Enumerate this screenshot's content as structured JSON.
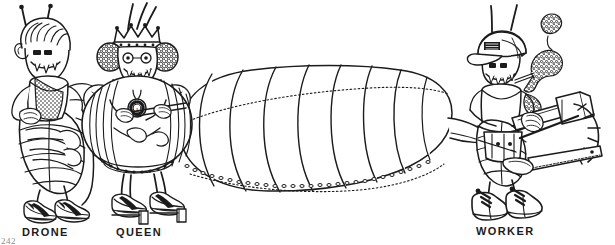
{
  "page": {
    "width": 615,
    "height": 245,
    "background_color": "#ffffff",
    "ink_color": "#1b1b1b",
    "folio_number": "242",
    "header_fragment": ""
  },
  "illustration": {
    "title": "Bee castes line drawing",
    "style": "black and white cartoon line art",
    "figure_count": 3
  },
  "captions": {
    "drone": "DRONE",
    "queen": "QUEEN",
    "worker": "WORKER"
  },
  "figures": [
    {
      "id": "drone",
      "label": "DRONE",
      "features": [
        "antennae",
        "pompadour hair",
        "fanged grin",
        "mesh vest",
        "striped abdomen",
        "sneakers",
        "folded arms"
      ]
    },
    {
      "id": "queen",
      "label": "QUEEN",
      "features": [
        "crown",
        "antennae",
        "curly hair",
        "eyeglasses",
        "medallion",
        "giant segmented abdomen",
        "platform heels"
      ],
      "medallion_text": "1"
    },
    {
      "id": "worker",
      "label": "WORKER",
      "features": [
        "baseball cap",
        "antennae",
        "cigarette",
        "smoke plume",
        "t-shirt",
        "tool belt",
        "hammer",
        "rake",
        "saw",
        "work boots"
      ]
    }
  ]
}
